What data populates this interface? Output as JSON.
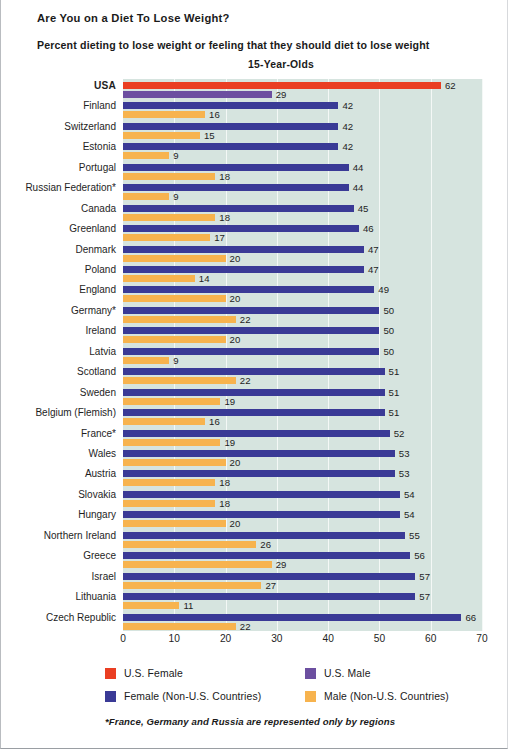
{
  "titles": {
    "main": "Are You on a Diet To Lose Weight?",
    "sub": "Percent dieting to lose weight or feeling that they should diet to lose weight",
    "chart_heading": "15-Year-Olds"
  },
  "legend": {
    "items": [
      {
        "label": "U.S. Female",
        "color": "#ea3e22",
        "column": 1,
        "row": 1
      },
      {
        "label": "U.S. Male",
        "color": "#6c4fa0",
        "column": 2,
        "row": 1
      },
      {
        "label": "Female (Non-U.S. Countries)",
        "color": "#3a3a96",
        "column": 1,
        "row": 2
      },
      {
        "label": "Male (Non-U.S. Countries)",
        "color": "#f7b34e",
        "column": 2,
        "row": 2
      }
    ]
  },
  "footnote": "*France, Germany and Russia are represented only by regions",
  "chart_data": {
    "type": "bar",
    "title": "Are You on a Diet To Lose Weight?",
    "subtitle": "Percent dieting to lose weight or feeling that they should diet to lose weight",
    "group": "15-Year-Olds",
    "orientation": "horizontal",
    "grouped": true,
    "xlabel": "",
    "ylabel": "",
    "xlim": [
      0,
      70
    ],
    "xticks": [
      0,
      10,
      20,
      30,
      40,
      50,
      60,
      70
    ],
    "grid": true,
    "legend_position": "bottom",
    "categories": [
      "USA",
      "Finland",
      "Switzerland",
      "Estonia",
      "Portugal",
      "Russian Federation*",
      "Canada",
      "Greenland",
      "Denmark",
      "Poland",
      "England",
      "Germany*",
      "Ireland",
      "Latvia",
      "Scotland",
      "Sweden",
      "Belgium (Flemish)",
      "France*",
      "Wales",
      "Austria",
      "Slovakia",
      "Hungary",
      "Northern Ireland",
      "Greece",
      "Israel",
      "Lithuania",
      "Czech Republic"
    ],
    "series": [
      {
        "name": "Female",
        "color": "#3a3a96",
        "us_color": "#ea3e22",
        "values": [
          62,
          42,
          42,
          42,
          44,
          44,
          45,
          46,
          47,
          47,
          49,
          50,
          50,
          50,
          51,
          51,
          51,
          52,
          53,
          53,
          54,
          54,
          55,
          56,
          57,
          57,
          66
        ]
      },
      {
        "name": "Male",
        "color": "#f7b34e",
        "us_color": "#6c4fa0",
        "values": [
          29,
          16,
          15,
          9,
          18,
          9,
          18,
          17,
          20,
          14,
          20,
          22,
          20,
          9,
          22,
          19,
          16,
          19,
          20,
          18,
          18,
          20,
          26,
          29,
          27,
          11,
          22
        ]
      }
    ]
  }
}
